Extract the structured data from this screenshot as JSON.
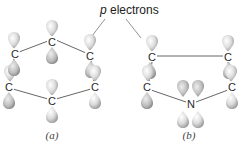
{
  "diagram": {
    "title_label": "p electrons",
    "title_label_italic_part": "p",
    "title_label_rest": " electrons",
    "panels": [
      {
        "caption": "(a)",
        "caption_letter": "a",
        "molecule": "benzene",
        "atoms": [
          {
            "symbol": "C",
            "x": 52,
            "y": 42
          },
          {
            "symbol": "C",
            "x": 90,
            "y": 56
          },
          {
            "symbol": "C",
            "x": 95,
            "y": 87
          },
          {
            "symbol": "C",
            "x": 52,
            "y": 101
          },
          {
            "symbol": "C",
            "x": 9,
            "y": 87
          },
          {
            "symbol": "C",
            "x": 15,
            "y": 54
          }
        ]
      },
      {
        "caption": "(b)",
        "caption_letter": "b",
        "molecule": "pyrrole",
        "atoms": [
          {
            "symbol": "C",
            "x": 152,
            "y": 57
          },
          {
            "symbol": "C",
            "x": 228,
            "y": 57
          },
          {
            "symbol": "C",
            "x": 232,
            "y": 87
          },
          {
            "symbol": "N",
            "x": 191,
            "y": 104
          },
          {
            "symbol": "C",
            "x": 147,
            "y": 87
          }
        ]
      }
    ],
    "colors": {
      "orbital_light": "#f2f2f2",
      "orbital_dark": "#9a9a9a",
      "bond": "#555555",
      "text": "#222222"
    }
  }
}
